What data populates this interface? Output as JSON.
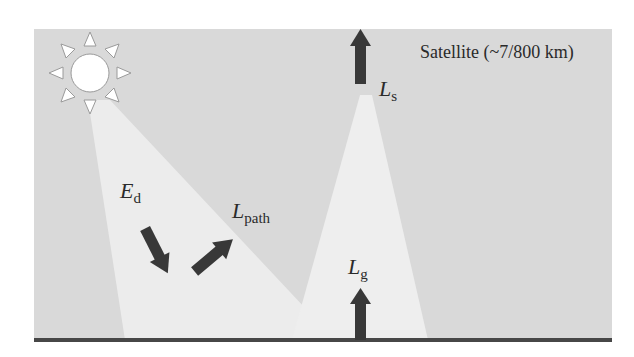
{
  "diagram": {
    "title": "Satellite (~7/800 km)",
    "colors": {
      "background": "#ffffff",
      "panel": "#d9d9d9",
      "beam": "#eeeeee",
      "beam_overlap": "#f4f4f4",
      "arrow": "#383838",
      "ground": "#474747",
      "sun_fill": "#ffffff",
      "sun_stroke": "#9a9a9a",
      "text": "#2a2a2a"
    },
    "labels": {
      "ed": {
        "main": "E",
        "sub": "d"
      },
      "lpath": {
        "main": "L",
        "sub": "path"
      },
      "ls": {
        "main": "L",
        "sub": "s"
      },
      "lg": {
        "main": "L",
        "sub": "g"
      }
    },
    "nodes": [
      {
        "id": "sun",
        "label": "Sun"
      },
      {
        "id": "satellite",
        "label": "Satellite (~7/800 km)"
      },
      {
        "id": "ground",
        "label": "Ground surface"
      }
    ],
    "edges": [
      {
        "id": "ed-arrow",
        "label": "Ed",
        "direction": "downward (sun to surface)"
      },
      {
        "id": "lpath-arrow",
        "label": "Lpath",
        "direction": "upward scattered"
      },
      {
        "id": "lg-arrow",
        "label": "Lg",
        "direction": "upward from ground"
      },
      {
        "id": "ls-arrow",
        "label": "Ls",
        "direction": "upward to satellite"
      }
    ]
  }
}
